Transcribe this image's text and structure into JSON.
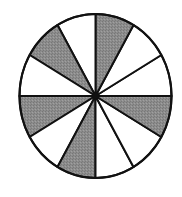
{
  "chart_data": {
    "type": "pie",
    "title": "",
    "total_sectors": 12,
    "shaded_sectors": 5,
    "fraction_shaded": "5/12",
    "sector_angle_deg": 30,
    "sectors": [
      {
        "start": 0,
        "end": 30,
        "shaded": false
      },
      {
        "start": 30,
        "end": 60,
        "shaded": false
      },
      {
        "start": 60,
        "end": 90,
        "shaded": true
      },
      {
        "start": 90,
        "end": 120,
        "shaded": false
      },
      {
        "start": 120,
        "end": 150,
        "shaded": true
      },
      {
        "start": 150,
        "end": 180,
        "shaded": false
      },
      {
        "start": 180,
        "end": 210,
        "shaded": true
      },
      {
        "start": 210,
        "end": 240,
        "shaded": false
      },
      {
        "start": 240,
        "end": 270,
        "shaded": true
      },
      {
        "start": 270,
        "end": 300,
        "shaded": false
      },
      {
        "start": 300,
        "end": 330,
        "shaded": false
      },
      {
        "start": 330,
        "end": 360,
        "shaded": true
      }
    ]
  },
  "colors": {
    "shaded": "#8c8c8c",
    "unshaded": "#ffffff",
    "stroke": "#111111"
  },
  "geometry": {
    "cx": 95.5,
    "cy": 96,
    "rx": 76,
    "ry": 82
  }
}
